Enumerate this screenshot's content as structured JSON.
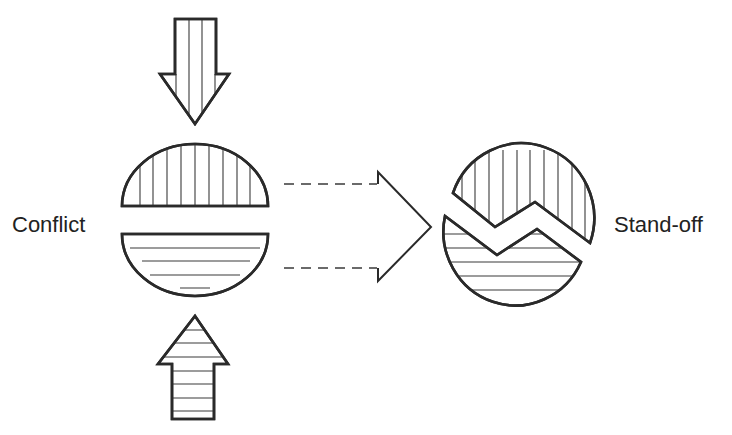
{
  "diagram": {
    "labels": {
      "left": "Conflict",
      "right": "Stand-off"
    },
    "elements": {
      "top_arrow": {
        "direction": "down",
        "hatch": "vertical"
      },
      "bottom_arrow": {
        "direction": "up",
        "hatch": "horizontal"
      },
      "upper_half_circle": {
        "hatch": "vertical"
      },
      "lower_half_circle": {
        "hatch": "horizontal"
      },
      "transition_arrow": {
        "direction": "right",
        "style": "dashed-shaft"
      },
      "standoff_circle": {
        "split": "zigzag",
        "upper_hatch": "vertical",
        "lower_hatch": "horizontal"
      }
    },
    "colors": {
      "stroke": "#2a2a2a",
      "background": "#ffffff",
      "text": "#222222"
    }
  }
}
